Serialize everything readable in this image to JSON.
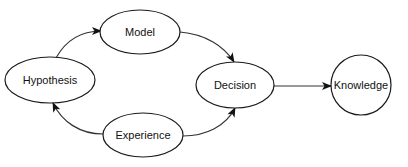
{
  "diagram": {
    "type": "flow",
    "colors": {
      "stroke": "#1a1a1a",
      "fill": "#ffffff",
      "text": "#111111"
    },
    "nodes": [
      {
        "id": "hypothesis",
        "label": "Hypothesis",
        "shape": "ellipse"
      },
      {
        "id": "model",
        "label": "Model",
        "shape": "ellipse"
      },
      {
        "id": "experience",
        "label": "Experience",
        "shape": "ellipse"
      },
      {
        "id": "decision",
        "label": "Decision",
        "shape": "ellipse"
      },
      {
        "id": "knowledge",
        "label": "Knowledge",
        "shape": "circle"
      }
    ],
    "edges": [
      {
        "from": "hypothesis",
        "to": "model",
        "style": "curved"
      },
      {
        "from": "model",
        "to": "decision",
        "style": "curved"
      },
      {
        "from": "experience",
        "to": "hypothesis",
        "style": "curved"
      },
      {
        "from": "experience",
        "to": "decision",
        "style": "curved"
      },
      {
        "from": "decision",
        "to": "knowledge",
        "style": "straight"
      }
    ]
  }
}
